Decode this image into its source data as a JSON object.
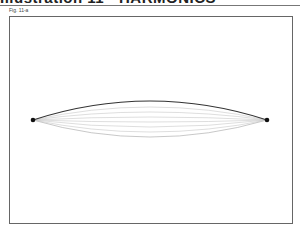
{
  "header": {
    "title": "Illustration 11 - HARMONICS"
  },
  "figure": {
    "label": "Fig. 11-a",
    "endpoints": [
      {
        "x": 33,
        "y": 120
      },
      {
        "x": 267,
        "y": 120
      }
    ],
    "curves": [
      {
        "peak_y": 101,
        "color": "#333333",
        "width": 1.2
      },
      {
        "peak_y": 107,
        "color": "#c8c8c8",
        "width": 0.6
      },
      {
        "peak_y": 112,
        "color": "#c8c8c8",
        "width": 0.6
      },
      {
        "peak_y": 117,
        "color": "#c8c8c8",
        "width": 0.6
      },
      {
        "peak_y": 122,
        "color": "#c8c8c8",
        "width": 0.6
      },
      {
        "peak_y": 127,
        "color": "#c8c8c8",
        "width": 0.6
      },
      {
        "peak_y": 132,
        "color": "#c8c8c8",
        "width": 0.6
      },
      {
        "peak_y": 137,
        "color": "#b0b0b0",
        "width": 0.7
      }
    ]
  }
}
